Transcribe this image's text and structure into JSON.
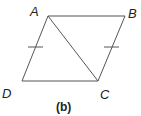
{
  "figure": {
    "caption": "(b)",
    "vertices": {
      "A": {
        "label": "A",
        "x": 48,
        "y": 16
      },
      "B": {
        "label": "B",
        "x": 125,
        "y": 16
      },
      "C": {
        "label": "C",
        "x": 98,
        "y": 81
      },
      "D": {
        "label": "D",
        "x": 22,
        "y": 81
      }
    },
    "segments": [
      "AB",
      "BC",
      "CD",
      "DA",
      "AC"
    ],
    "congruence_marks": [
      "AD",
      "BC"
    ],
    "stroke_color": "#555555"
  }
}
